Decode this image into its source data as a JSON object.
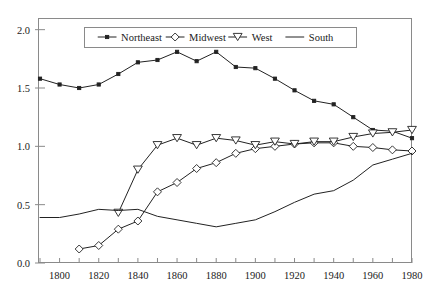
{
  "chart_data": {
    "type": "line",
    "title": "",
    "subtitle": "",
    "xlabel": "",
    "ylabel": "",
    "xlim": [
      1790,
      1980
    ],
    "ylim": [
      0.0,
      2.1
    ],
    "grid": false,
    "legend_position": "top-center",
    "x_ticks": [
      1800,
      1820,
      1840,
      1860,
      1880,
      1900,
      1920,
      1940,
      1960,
      1980
    ],
    "x_tick_labels": [
      "1800",
      "1820",
      "1840",
      "1860",
      "1880",
      "1900",
      "1920",
      "1940",
      "1960",
      "1980"
    ],
    "x_minor_ticks": [
      1790,
      1810,
      1830,
      1850,
      1870,
      1890,
      1910,
      1930,
      1950,
      1970
    ],
    "y_ticks": [
      0.0,
      0.5,
      1.0,
      1.5,
      2.0
    ],
    "y_tick_labels": [
      "0.0",
      "0.5",
      "1.0",
      "1.5",
      "2.0"
    ],
    "series": [
      {
        "name": "Northeast",
        "marker": "filled-square",
        "x": [
          1790,
          1800,
          1810,
          1820,
          1830,
          1840,
          1850,
          1860,
          1870,
          1880,
          1890,
          1900,
          1910,
          1920,
          1930,
          1940,
          1950,
          1960,
          1970,
          1980
        ],
        "values": [
          1.58,
          1.53,
          1.5,
          1.53,
          1.62,
          1.72,
          1.74,
          1.81,
          1.73,
          1.81,
          1.68,
          1.67,
          1.58,
          1.48,
          1.39,
          1.36,
          1.25,
          1.14,
          1.13,
          1.07
        ]
      },
      {
        "name": "Midwest",
        "marker": "open-diamond",
        "x": [
          1810,
          1820,
          1830,
          1840,
          1850,
          1860,
          1870,
          1880,
          1890,
          1900,
          1910,
          1920,
          1930,
          1940,
          1950,
          1960,
          1970,
          1980
        ],
        "values": [
          0.12,
          0.15,
          0.29,
          0.36,
          0.61,
          0.69,
          0.81,
          0.86,
          0.94,
          0.98,
          1.0,
          1.02,
          1.03,
          1.03,
          1.0,
          0.99,
          0.97,
          0.96
        ]
      },
      {
        "name": "West",
        "marker": "open-triangle-down",
        "x": [
          1830,
          1840,
          1850,
          1860,
          1870,
          1880,
          1890,
          1900,
          1910,
          1920,
          1930,
          1940,
          1950,
          1960,
          1970,
          1980
        ],
        "values": [
          0.43,
          0.8,
          1.01,
          1.07,
          1.01,
          1.07,
          1.05,
          1.01,
          1.04,
          1.02,
          1.04,
          1.04,
          1.08,
          1.11,
          1.12,
          1.14
        ]
      },
      {
        "name": "South",
        "marker": "none",
        "x": [
          1790,
          1800,
          1810,
          1820,
          1830,
          1840,
          1850,
          1860,
          1870,
          1880,
          1890,
          1900,
          1910,
          1920,
          1930,
          1940,
          1950,
          1960,
          1970,
          1980
        ],
        "values": [
          0.39,
          0.39,
          0.42,
          0.46,
          0.45,
          0.46,
          0.4,
          0.37,
          0.34,
          0.31,
          0.34,
          0.37,
          0.44,
          0.52,
          0.59,
          0.62,
          0.71,
          0.84,
          0.89,
          0.94
        ]
      }
    ],
    "legend_entries": [
      {
        "label": "Northeast",
        "marker": "filled-square"
      },
      {
        "label": "Midwest",
        "marker": "open-diamond"
      },
      {
        "label": "West",
        "marker": "open-triangle-down"
      },
      {
        "label": "South",
        "marker": "none"
      }
    ],
    "colors": {
      "line": "#222222",
      "frame": "#8a8a8a",
      "background": "#ffffff",
      "text": "#1a1a1a"
    }
  }
}
